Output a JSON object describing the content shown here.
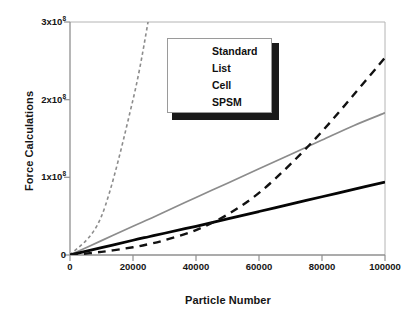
{
  "chart_data": {
    "type": "line",
    "title": "",
    "xlabel": "Particle Number",
    "ylabel": "Force Calculations",
    "xlim": [
      0,
      100000
    ],
    "ylim": [
      0,
      300000000
    ],
    "grid": false,
    "legend_position": "top-center",
    "xticks": [
      {
        "value": 0,
        "label": "0"
      },
      {
        "value": 20000,
        "label": "20000"
      },
      {
        "value": 40000,
        "label": "40000"
      },
      {
        "value": 60000,
        "label": "60000"
      },
      {
        "value": 80000,
        "label": "80000"
      },
      {
        "value": 100000,
        "label": "100000"
      }
    ],
    "yticks": [
      {
        "value": 0,
        "mantissa": "0",
        "exponent": "",
        "label": "0"
      },
      {
        "value": 100000000,
        "mantissa": "1x10",
        "exponent": "8",
        "label": "1x10^8"
      },
      {
        "value": 200000000,
        "mantissa": "2x10",
        "exponent": "8",
        "label": "2x10^8"
      },
      {
        "value": 300000000,
        "mantissa": "3x10",
        "exponent": "8",
        "label": "3x10^8"
      }
    ],
    "x": [
      0,
      10000,
      20000,
      25000,
      30000,
      40000,
      50000,
      60000,
      70000,
      80000,
      90000,
      100000
    ],
    "series": [
      {
        "name": "Standard",
        "color": "#8c8c8c",
        "style": "fine-dashed",
        "width": 1.6,
        "values": [
          0,
          50000000,
          200000000,
          305000000,
          null,
          null,
          null,
          null,
          null,
          null,
          null,
          null
        ],
        "clipped_at_top": true,
        "note": "quadratic, leaves plot area near 24500 particles"
      },
      {
        "name": "List",
        "color": "#111111",
        "style": "dashed",
        "width": 2.4,
        "values": [
          0,
          4000000,
          10000000,
          14000000,
          19000000,
          32000000,
          52000000,
          80000000,
          117000000,
          159000000,
          206000000,
          254000000
        ]
      },
      {
        "name": "Cell",
        "color": "#8c8c8c",
        "style": "solid",
        "width": 1.7,
        "values": [
          0,
          18500000,
          37000000,
          46000000,
          55500000,
          74000000,
          92500000,
          111000000,
          129500000,
          148000000,
          166500000,
          183000000
        ]
      },
      {
        "name": "SPSM",
        "color": "#050505",
        "style": "solid",
        "width": 2.8,
        "values": [
          0,
          9500000,
          19000000,
          23500000,
          28000000,
          37000000,
          46500000,
          56000000,
          65500000,
          75000000,
          84500000,
          94000000
        ]
      }
    ]
  },
  "legend": {
    "entries": [
      {
        "label": "Standard"
      },
      {
        "label": "List"
      },
      {
        "label": "Cell"
      },
      {
        "label": "SPSM"
      }
    ]
  },
  "axes": {
    "y_title": "Force Calculations",
    "x_title": "Particle Number"
  }
}
